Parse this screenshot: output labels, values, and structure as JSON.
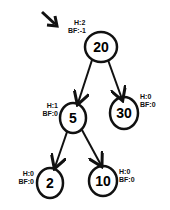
{
  "diagram": {
    "type": "avl-tree",
    "pointer_arrow": "root-pointer",
    "nodes": [
      {
        "id": "n20",
        "value": "20",
        "height_label": "H:2",
        "bf_label": "BF:-1"
      },
      {
        "id": "n5",
        "value": "5",
        "height_label": "H:1",
        "bf_label": "BF:0"
      },
      {
        "id": "n30",
        "value": "30",
        "height_label": "H:0",
        "bf_label": "BF:0"
      },
      {
        "id": "n2",
        "value": "2",
        "height_label": "H:0",
        "bf_label": "BF:0"
      },
      {
        "id": "n10",
        "value": "10",
        "height_label": "H:0",
        "bf_label": "BF:0"
      }
    ],
    "edges": [
      {
        "from": "20",
        "to": "5"
      },
      {
        "from": "20",
        "to": "30"
      },
      {
        "from": "5",
        "to": "2"
      },
      {
        "from": "5",
        "to": "10"
      }
    ]
  }
}
